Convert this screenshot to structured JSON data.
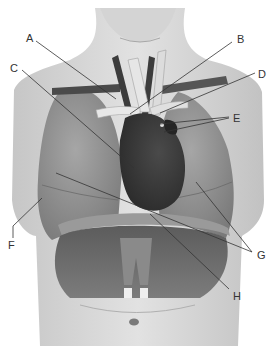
{
  "diagram": {
    "colors": {
      "background": "#ffffff",
      "skin_light": "#d9d9d9",
      "skin_mid": "#bdbdbd",
      "lung": "#8e8e8e",
      "heart": "#3e3e3e",
      "vessel_dark": "#4a4a4a",
      "vessel_light": "#e4e4e4",
      "diaphragm": "#6f6f6f",
      "leader_line": "#333333",
      "label_text": "#333333"
    },
    "labels": [
      {
        "id": "A",
        "text": "A",
        "x": 26,
        "y": 33
      },
      {
        "id": "B",
        "text": "B",
        "x": 237,
        "y": 34
      },
      {
        "id": "C",
        "text": "C",
        "x": 10,
        "y": 63
      },
      {
        "id": "D",
        "text": "D",
        "x": 258,
        "y": 69
      },
      {
        "id": "E",
        "text": "E",
        "x": 233,
        "y": 113
      },
      {
        "id": "F",
        "text": "F",
        "x": 8,
        "y": 240
      },
      {
        "id": "G",
        "text": "G",
        "x": 257,
        "y": 250
      },
      {
        "id": "H",
        "text": "H",
        "x": 233,
        "y": 291
      }
    ]
  }
}
